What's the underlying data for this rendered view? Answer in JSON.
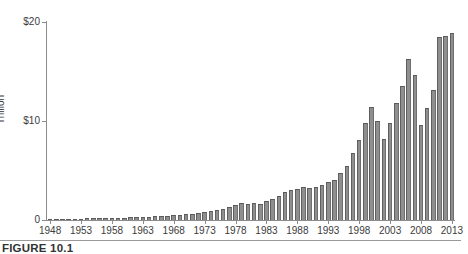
{
  "figure": {
    "caption": "FIGURE 10.1"
  },
  "chart_data": {
    "type": "bar",
    "title": "",
    "xlabel": "",
    "ylabel": "Trillion",
    "ylim": [
      0,
      20
    ],
    "grid": false,
    "legend": null,
    "y_ticks": [
      {
        "value": 0,
        "label": "0"
      },
      {
        "value": 10,
        "label": "$10"
      },
      {
        "value": 20,
        "label": "$20"
      }
    ],
    "x_tick_labels": [
      "1948",
      "1953",
      "1958",
      "1963",
      "1968",
      "1973",
      "1978",
      "1983",
      "1988",
      "1993",
      "1998",
      "2003",
      "2008",
      "2013"
    ],
    "categories": [
      "1948",
      "1949",
      "1950",
      "1951",
      "1952",
      "1953",
      "1954",
      "1955",
      "1956",
      "1957",
      "1958",
      "1959",
      "1960",
      "1961",
      "1962",
      "1963",
      "1964",
      "1965",
      "1966",
      "1967",
      "1968",
      "1969",
      "1970",
      "1971",
      "1972",
      "1973",
      "1974",
      "1975",
      "1976",
      "1977",
      "1978",
      "1979",
      "1980",
      "1981",
      "1982",
      "1983",
      "1984",
      "1985",
      "1986",
      "1987",
      "1988",
      "1989",
      "1990",
      "1991",
      "1992",
      "1993",
      "1994",
      "1995",
      "1996",
      "1997",
      "1998",
      "1999",
      "2000",
      "2001",
      "2002",
      "2003",
      "2004",
      "2005",
      "2006",
      "2007",
      "2008",
      "2009",
      "2010",
      "2011",
      "2012",
      "2013"
    ],
    "values": [
      0.1,
      0.11,
      0.12,
      0.13,
      0.14,
      0.15,
      0.16,
      0.18,
      0.19,
      0.2,
      0.21,
      0.23,
      0.24,
      0.26,
      0.28,
      0.3,
      0.33,
      0.36,
      0.39,
      0.43,
      0.48,
      0.52,
      0.56,
      0.63,
      0.72,
      0.83,
      0.88,
      0.98,
      1.15,
      1.35,
      1.55,
      1.7,
      1.6,
      1.75,
      1.65,
      1.9,
      2.15,
      2.45,
      2.8,
      3.0,
      3.1,
      3.3,
      3.2,
      3.3,
      3.55,
      3.85,
      4.05,
      4.7,
      5.5,
      6.8,
      8.1,
      9.8,
      11.4,
      10.0,
      8.2,
      9.8,
      11.8,
      13.5,
      16.3,
      14.6,
      9.6,
      11.3,
      13.1,
      18.5,
      18.6,
      18.9
    ],
    "colors": {
      "bar_fill": "#8f8f8f",
      "bar_edge": "#5a5a5a",
      "axis": "#8c8c8c",
      "text": "#3b3b3b",
      "background": "#ffffff"
    }
  }
}
